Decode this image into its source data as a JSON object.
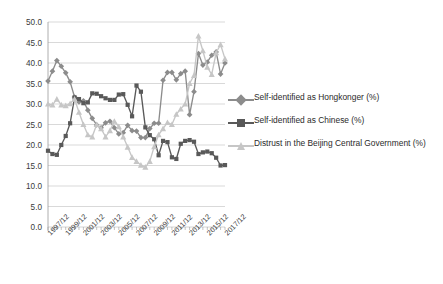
{
  "chart_data": {
    "type": "line",
    "title": "",
    "xlabel": "",
    "ylabel": "",
    "ylim": [
      0.0,
      50.0
    ],
    "ytick_step": 5.0,
    "grid": true,
    "legend_position": "right",
    "yticks": [
      "0.0",
      "5.0",
      "10.0",
      "15.0",
      "20.0",
      "25.0",
      "30.0",
      "35.0",
      "40.0",
      "45.0",
      "50.0"
    ],
    "xticks": [
      "1997/12",
      "1999/12",
      "2001/12",
      "2003/12",
      "2005/12",
      "2007/12",
      "2009/12",
      "2011/12",
      "2013/12",
      "2015/12",
      "2017/12"
    ],
    "x": [
      "1997/12",
      "1998/06",
      "1998/12",
      "1999/06",
      "1999/12",
      "2000/06",
      "2000/12",
      "2001/06",
      "2001/12",
      "2002/06",
      "2002/12",
      "2003/06",
      "2003/12",
      "2004/06",
      "2004/12",
      "2005/06",
      "2005/12",
      "2006/06",
      "2006/12",
      "2007/06",
      "2007/12",
      "2008/06",
      "2008/12",
      "2009/06",
      "2009/12",
      "2010/06",
      "2010/12",
      "2011/06",
      "2011/12",
      "2012/06",
      "2012/12",
      "2013/06",
      "2013/12",
      "2014/06",
      "2014/12",
      "2015/06",
      "2015/12",
      "2016/06",
      "2016/12",
      "2017/06",
      "2017/12"
    ],
    "series": [
      {
        "name": "Self-identified as Hongkonger (%)",
        "color": "#8c8c8c",
        "marker": "diamond",
        "values": [
          35.6,
          38.0,
          40.6,
          39.2,
          37.6,
          35.4,
          31.7,
          30.5,
          30.8,
          28.5,
          26.5,
          24.9,
          24.2,
          25.4,
          25.8,
          24.2,
          22.7,
          23.0,
          24.8,
          23.5,
          23.4,
          21.8,
          21.8,
          24.0,
          25.3,
          25.3,
          35.8,
          37.7,
          37.7,
          35.9,
          37.4,
          38.0,
          27.4,
          33.0,
          42.3,
          39.5,
          40.2,
          41.9,
          42.7,
          37.3,
          40.0
        ]
      },
      {
        "name": "Self-identified as Chinese (%)",
        "color": "#595959",
        "marker": "square",
        "values": [
          18.6,
          17.8,
          17.6,
          20.0,
          22.2,
          25.3,
          31.6,
          31.2,
          30.2,
          30.4,
          32.6,
          32.5,
          31.9,
          31.4,
          31.0,
          31.0,
          32.3,
          32.4,
          29.8,
          27.0,
          34.5,
          33.0,
          24.3,
          22.4,
          21.4,
          17.5,
          21.0,
          20.7,
          17.0,
          16.6,
          20.3,
          21.0,
          21.2,
          20.8,
          17.8,
          18.2,
          18.4,
          18.0,
          16.9,
          15.0,
          15.1
        ]
      },
      {
        "name": "Distrust in the Beijing Central Government (%)",
        "color": "#c6c6c6",
        "marker": "triangle",
        "values": [
          30.0,
          29.8,
          31.2,
          29.8,
          29.6,
          30.1,
          31.2,
          28.0,
          25.0,
          22.5,
          22.0,
          25.0,
          24.0,
          22.0,
          23.5,
          25.8,
          24.5,
          22.0,
          19.5,
          17.0,
          16.0,
          15.1,
          14.6,
          16.0,
          19.6,
          22.5,
          24.0,
          25.5,
          25.0,
          27.5,
          28.8,
          30.0,
          35.0,
          37.0,
          46.6,
          43.0,
          39.0,
          37.2,
          42.5,
          44.5,
          41.0
        ]
      }
    ]
  },
  "legend": {
    "items": [
      {
        "label": "Self-identified as Hongkonger (%)",
        "color": "#8c8c8c",
        "marker": "diamond"
      },
      {
        "label": "Self-identified as Chinese (%)",
        "color": "#595959",
        "marker": "square"
      },
      {
        "label": "Distrust in the Beijing Central Government (%)",
        "color": "#c6c6c6",
        "marker": "triangle"
      }
    ]
  },
  "axis": {
    "plot_left": 48,
    "plot_right": 225,
    "plot_top": 22,
    "plot_bottom": 227
  }
}
